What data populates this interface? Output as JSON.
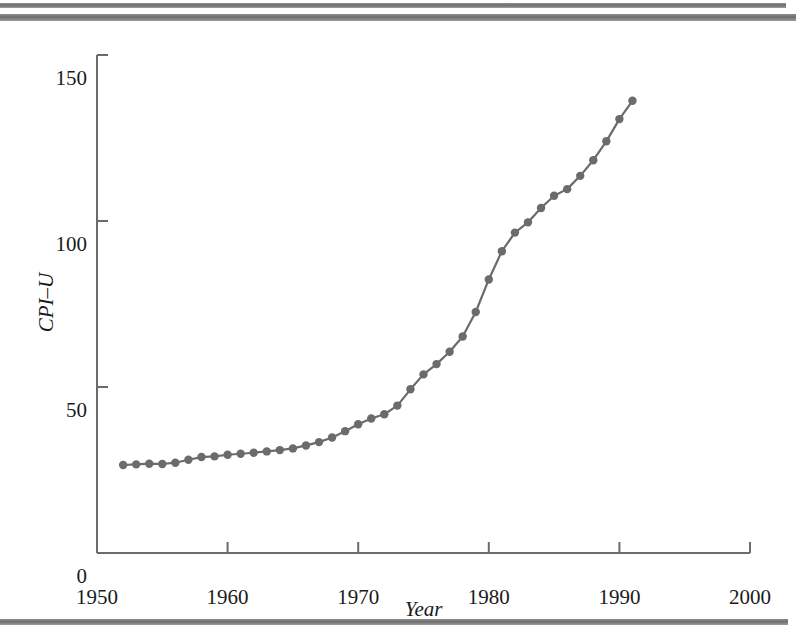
{
  "figure": {
    "decorations": {
      "top_rule_1": "horizontal-rule",
      "top_rule_2": "horizontal-rule",
      "bottom_rule": "horizontal-rule",
      "rule_color": "#7a7a7a"
    }
  },
  "chart_data": {
    "type": "line",
    "title": "",
    "xlabel": "Year",
    "ylabel": "CPI–U",
    "xlim": [
      1950,
      2000
    ],
    "ylim": [
      0,
      150
    ],
    "xticks": [
      1950,
      1960,
      1970,
      1980,
      1990,
      2000
    ],
    "xtick_labels": [
      "1950",
      "1960",
      "1970",
      "1980",
      "1990",
      "2000"
    ],
    "yticks": [
      0,
      50,
      100,
      150
    ],
    "ytick_labels": [
      "0",
      "50",
      "100",
      "150"
    ],
    "grid": false,
    "legend": null,
    "line_color": "#6b6b6b",
    "marker": "circle",
    "marker_color": "#6b6b6b",
    "axis_color": "#6b6b6b",
    "series": [
      {
        "name": "CPI-U",
        "x": [
          1952,
          1953,
          1954,
          1955,
          1956,
          1957,
          1958,
          1959,
          1960,
          1961,
          1962,
          1963,
          1964,
          1965,
          1966,
          1967,
          1968,
          1969,
          1970,
          1971,
          1972,
          1973,
          1974,
          1975,
          1976,
          1977,
          1978,
          1979,
          1980,
          1981,
          1982,
          1983,
          1984,
          1985,
          1986,
          1987,
          1988,
          1989,
          1990,
          1991
        ],
        "values": [
          26.5,
          26.7,
          26.9,
          26.8,
          27.2,
          28.1,
          28.9,
          29.1,
          29.6,
          29.9,
          30.2,
          30.6,
          31.0,
          31.5,
          32.4,
          33.4,
          34.8,
          36.7,
          38.8,
          40.5,
          41.8,
          44.4,
          49.3,
          53.8,
          56.9,
          60.6,
          65.2,
          72.6,
          82.4,
          90.9,
          96.5,
          99.6,
          103.9,
          107.6,
          109.6,
          113.6,
          118.3,
          124.0,
          130.7,
          136.2
        ]
      }
    ]
  }
}
